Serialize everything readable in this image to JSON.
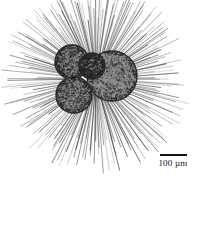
{
  "figure": {
    "kind": "scientific-line-illustration",
    "background_color": "#ffffff",
    "ink_color": "#1a1a1a",
    "width": 200,
    "height": 178
  },
  "scale_bar": {
    "value": "100",
    "unit": "µm",
    "label": "100 µm",
    "bar_color": "#111111",
    "bar_length_px": 27,
    "bar_thickness_px": 2,
    "position": {
      "x": 150,
      "y": 148
    }
  },
  "specimen": {
    "center": {
      "x": 95,
      "y": 80
    },
    "cells": [
      {
        "name": "large-cell",
        "cx": 112,
        "cy": 76,
        "r": 25,
        "shade": "#8d8d8d",
        "rim": "#2b2b2b"
      },
      {
        "name": "upper-left-cell",
        "cx": 72,
        "cy": 62,
        "r": 17,
        "shade": "#909090",
        "rim": "#2b2b2b"
      },
      {
        "name": "lower-left-cell",
        "cx": 74,
        "cy": 95,
        "r": 18,
        "shade": "#8e8e8e",
        "rim": "#2b2b2b"
      },
      {
        "name": "middle-small-cell",
        "cx": 92,
        "cy": 66,
        "r": 13,
        "shade": "#9a9a9a",
        "rim": "#2b2b2b"
      }
    ],
    "spicules": {
      "count": 230,
      "origin": {
        "x": 96,
        "y": 79
      },
      "inner_radius_min": 14,
      "inner_radius_max": 30,
      "outer_radius_min": 58,
      "outer_radius_max": 96,
      "color": "#3a3a3a",
      "width_px": 0.6
    },
    "stipple": {
      "density": 2600,
      "dot_radius_min": 0.35,
      "dot_radius_max": 0.95,
      "color": "#242424"
    }
  }
}
